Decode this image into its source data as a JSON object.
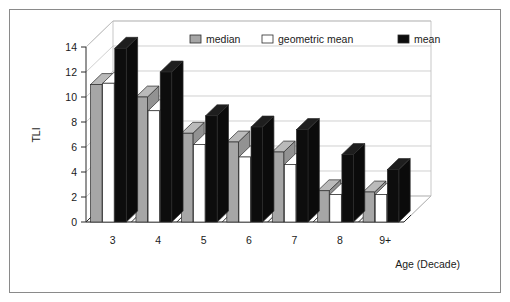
{
  "chart_data": {
    "type": "bar",
    "title": "",
    "subtitle": "",
    "xlabel": "Age (Decade)",
    "ylabel": "TLI",
    "categories": [
      "3",
      "4",
      "5",
      "6",
      "7",
      "8",
      "9+"
    ],
    "series": [
      {
        "name": "median",
        "color": "#a6a6a6",
        "values": [
          11.0,
          10.0,
          7.1,
          6.4,
          5.6,
          2.5,
          2.4
        ]
      },
      {
        "name": "geometric mean",
        "color": "#ffffff",
        "values": [
          11.1,
          8.9,
          6.2,
          5.2,
          4.6,
          2.2,
          2.2
        ]
      },
      {
        "name": "mean",
        "color": "#0d0d0d",
        "values": [
          13.9,
          12.0,
          8.5,
          7.6,
          7.4,
          5.4,
          4.2
        ]
      }
    ],
    "ylim": [
      0,
      14
    ],
    "yticks": [
      "0",
      "2",
      "4",
      "6",
      "8",
      "10",
      "12",
      "14"
    ],
    "ytick_values": [
      0,
      2,
      4,
      6,
      8,
      10,
      12,
      14
    ],
    "grid": true,
    "legend_position": "top",
    "style": "3d-clustered-column"
  },
  "legend": {
    "items": [
      {
        "label": "median",
        "color": "#a6a6a6"
      },
      {
        "label": "geometric mean",
        "color": "#ffffff"
      },
      {
        "label": "mean",
        "color": "#0d0d0d"
      }
    ]
  },
  "axes": {
    "y_title": "TLI",
    "x_title": "Age (Decade)"
  }
}
